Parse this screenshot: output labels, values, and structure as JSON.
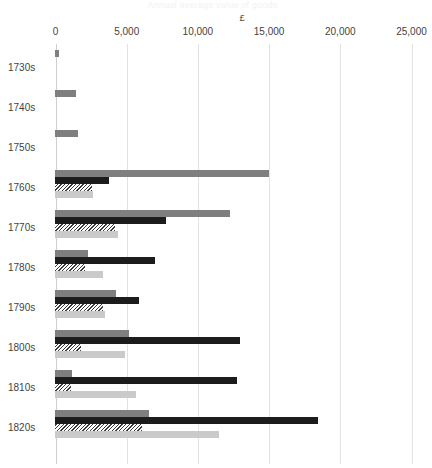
{
  "title_faint": "Annual average value of goods",
  "axis": {
    "unit_symbol": "£",
    "x_ticks": [
      "0",
      "5,000",
      "10,000",
      "15,000",
      "20,000",
      "25,000"
    ],
    "x_tick_values": [
      0,
      5000,
      10000,
      15000,
      20000,
      25000
    ],
    "y_categories": [
      "1730s",
      "1740s",
      "1750s",
      "1760s",
      "1770s",
      "1780s",
      "1790s",
      "1800s",
      "1810s",
      "1820s"
    ]
  },
  "colors": {
    "series_1": "#7f7f7f",
    "series_2": "#1c1c1c",
    "series_3_hatch": "#3a3a3a",
    "series_4": "#cacaca",
    "gridline": "#e2e2e2",
    "text": "#3f3f3f",
    "background": "#ffffff"
  },
  "chart_data": {
    "type": "bar",
    "orientation": "horizontal",
    "title": "",
    "xlabel": "£",
    "ylabel": "",
    "xlim": [
      0,
      25000
    ],
    "grid": true,
    "legend": "none",
    "categories": [
      "1730s",
      "1740s",
      "1750s",
      "1760s",
      "1770s",
      "1780s",
      "1790s",
      "1800s",
      "1810s",
      "1820s"
    ],
    "series": [
      {
        "name": "Series 1",
        "style": "solid-mid-grey",
        "color": "#7f7f7f",
        "values": [
          300,
          1500,
          1600,
          15000,
          12300,
          2300,
          4300,
          5200,
          1200,
          6600
        ]
      },
      {
        "name": "Series 2",
        "style": "solid-black",
        "color": "#1c1c1c",
        "values": [
          0,
          0,
          0,
          3800,
          7800,
          7000,
          5900,
          13000,
          12800,
          18500
        ]
      },
      {
        "name": "Series 3",
        "style": "hatched-diagonal",
        "color": "#3a3a3a",
        "values": [
          0,
          0,
          0,
          2600,
          4200,
          2100,
          3400,
          1800,
          1100,
          6100
        ]
      },
      {
        "name": "Series 4",
        "style": "solid-light-grey",
        "color": "#cacaca",
        "values": [
          0,
          0,
          0,
          2700,
          4400,
          3400,
          3500,
          4900,
          5700,
          11500
        ]
      }
    ]
  }
}
